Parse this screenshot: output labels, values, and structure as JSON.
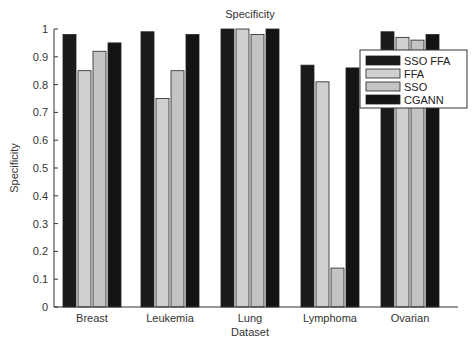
{
  "chart_data": {
    "type": "bar",
    "title": "Specificity",
    "xlabel": "Dataset",
    "ylabel": "Specificity",
    "categories": [
      "Breast",
      "Leukemia",
      "Lung",
      "Lymphoma",
      "Ovarian"
    ],
    "series": [
      {
        "name": "SSO FFA",
        "color": "#1a1a1a",
        "values": [
          0.98,
          0.99,
          1.0,
          0.87,
          0.99
        ]
      },
      {
        "name": "FFA",
        "color": "#d0d0d0",
        "values": [
          0.85,
          0.75,
          1.0,
          0.81,
          0.97
        ]
      },
      {
        "name": "SSO",
        "color": "#c4c4c4",
        "values": [
          0.92,
          0.85,
          0.98,
          0.14,
          0.96
        ]
      },
      {
        "name": "CGANN",
        "color": "#141414",
        "values": [
          0.95,
          0.98,
          1.0,
          0.86,
          0.98
        ]
      }
    ],
    "ylim": [
      0,
      1
    ],
    "yticks": [
      "0",
      "0.1",
      "0.2",
      "0.3",
      "0.4",
      "0.5",
      "0.6",
      "0.7",
      "0.8",
      "0.9",
      "1"
    ],
    "grid": false,
    "legend_position": "upper right"
  }
}
